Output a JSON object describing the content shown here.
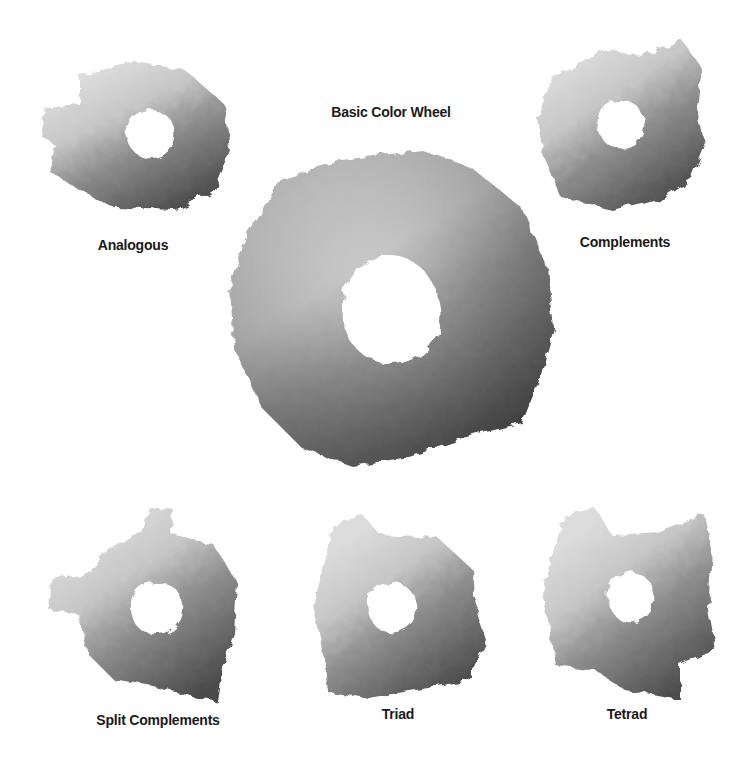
{
  "title": "Basic Color Wheel",
  "wheels": [
    {
      "id": "analogous",
      "label": "Analogous"
    },
    {
      "id": "complements",
      "label": "Complements"
    },
    {
      "id": "split-complements",
      "label": "Split Complements"
    },
    {
      "id": "triad",
      "label": "Triad"
    },
    {
      "id": "tetrad",
      "label": "Tetrad"
    }
  ],
  "tones": {
    "light": "#d9d9d9",
    "mid_light": "#b5b5b5",
    "mid": "#8e8e8e",
    "mid_dark": "#6c6c6c",
    "dark": "#4a4a4a",
    "background": "#ffffff"
  }
}
